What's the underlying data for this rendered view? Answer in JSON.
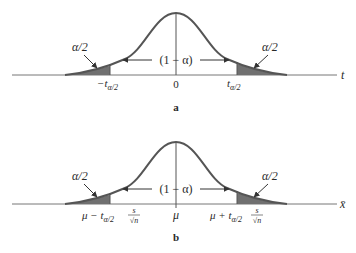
{
  "figure": {
    "panel_a": {
      "caption": "a",
      "axis_label": "t",
      "center_label": "0",
      "left_critical_label": "−t",
      "left_critical_sub": "α/2",
      "right_critical_label": "t",
      "right_critical_sub": "α/2",
      "left_tail_label": "α/2",
      "right_tail_label": "α/2",
      "middle_label": "(1 − α)"
    },
    "panel_b": {
      "caption": "b",
      "axis_label": "x̄",
      "center_label": "μ",
      "left_critical_prefix": "μ − t",
      "left_critical_sub": "α/2",
      "left_frac_num": "s",
      "left_frac_den": "√n",
      "right_critical_prefix": "μ + t",
      "right_critical_sub": "α/2",
      "right_frac_num": "s",
      "right_frac_den": "√n",
      "left_tail_label": "α/2",
      "right_tail_label": "α/2",
      "middle_label": "(1 − α)"
    },
    "colors": {
      "curve": "#555555",
      "shade": "#707070",
      "axis": "#777777",
      "text": "#2a2a2a"
    }
  }
}
